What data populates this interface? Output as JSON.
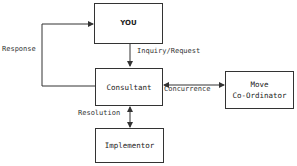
{
  "diagram": {
    "nodes": {
      "you": {
        "label": "YOU"
      },
      "consultant": {
        "label": "Consultant"
      },
      "move_coordinator": {
        "line1": "Move",
        "line2": "Co-Ordinator"
      },
      "implementor": {
        "label": "Implementor"
      }
    },
    "edges": {
      "inquiry": {
        "label": "Inquiry/Request",
        "from": "you",
        "to": "consultant"
      },
      "response": {
        "label": "Response",
        "from": "consultant",
        "to": "you"
      },
      "concurrence": {
        "label": "Concurrence",
        "between": [
          "consultant",
          "move_coordinator"
        ]
      },
      "resolution": {
        "label": "Resolution",
        "between": [
          "consultant",
          "implementor"
        ]
      }
    }
  }
}
